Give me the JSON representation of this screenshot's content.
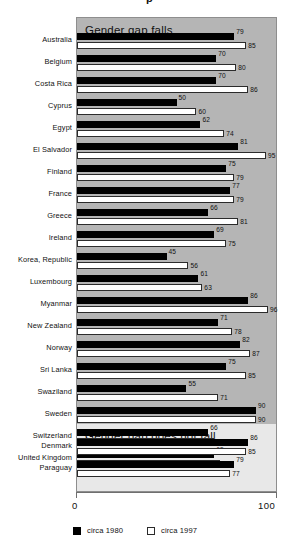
{
  "chart_data": {
    "type": "bar",
    "orientation": "horizontal",
    "title": "",
    "xlabel": "",
    "ylabel": "",
    "xlim": [
      0,
      100
    ],
    "xticks": [
      0,
      100
    ],
    "xtick_labels": [
      "0",
      "100"
    ],
    "grid": false,
    "legend_position": "bottom-left",
    "series": [
      {
        "name": "circa 1980",
        "color": "#000000",
        "key": "old"
      },
      {
        "name": "circa 1997",
        "color": "#ffffff",
        "key": "new"
      }
    ],
    "groups": [
      {
        "label": "Gender gap falls",
        "categories": [
          "Australia",
          "Belgium",
          "Costa Rica",
          "Cyprus",
          "Egypt",
          "El Salvador",
          "Finland",
          "France",
          "Greece",
          "Ireland",
          "Korea, Republic",
          "Luxembourg",
          "Myanmar",
          "New Zealand",
          "Norway",
          "Sri Lanka",
          "Swaziland",
          "Sweden",
          "Switzerland",
          "United Kingdom"
        ],
        "values_1980": [
          79,
          70,
          70,
          50,
          62,
          81,
          75,
          77,
          66,
          69,
          45,
          61,
          86,
          71,
          82,
          75,
          55,
          90,
          66,
          69
        ],
        "values_1997": [
          85,
          80,
          86,
          60,
          74,
          95,
          79,
          79,
          81,
          75,
          56,
          63,
          96,
          78,
          87,
          85,
          71,
          90,
          69,
          72
        ]
      },
      {
        "label": "Gender gap does not fall",
        "categories": [
          "Denmark",
          "Paraguay"
        ],
        "values_1980": [
          86,
          79
        ],
        "values_1997": [
          85,
          77
        ]
      }
    ]
  },
  "axis": {
    "min_label": "0",
    "max_label": "100"
  },
  "legend": {
    "items": [
      {
        "label": "circa 1980",
        "swatch": "filled-black-square"
      },
      {
        "label": "circa 1997",
        "swatch": "outline-white-square"
      }
    ]
  },
  "fragments": {
    "top": "p",
    "bottom": ""
  }
}
